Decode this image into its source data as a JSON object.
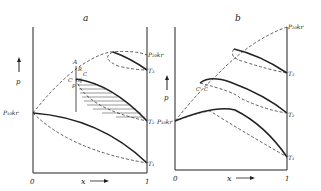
{
  "figure": {
    "panels": [
      {
        "id": "a",
        "title": "a",
        "y_axis_label": "p",
        "x_axis_label": "x",
        "x_start": "0",
        "x_end": "1",
        "labels": {
          "p1kr": "P₁₀kr",
          "p2kr": "P₂₀kr",
          "T1": "T₁",
          "T2": "T₂",
          "T3": "T₃",
          "A": "A",
          "R": "R",
          "C": "C",
          "Cprime": "C'",
          "Q": "Q",
          "P": "P"
        }
      },
      {
        "id": "b",
        "title": "b",
        "y_axis_label": "p",
        "x_axis_label": "x",
        "x_start": "0",
        "x_end": "1",
        "labels": {
          "p1kr": "P₁₀kr",
          "p2kr": "P₂₀kr",
          "T1": "T₁",
          "T2": "T₂",
          "T3": "T₃",
          "Cprime": "C'",
          "C": "C"
        }
      }
    ]
  }
}
